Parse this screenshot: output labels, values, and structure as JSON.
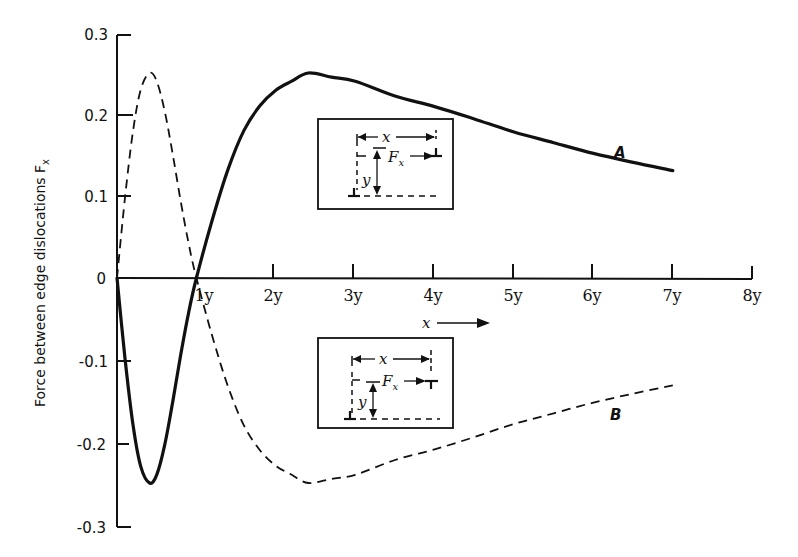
{
  "chart_data": {
    "type": "line",
    "title": "",
    "xlabel": "x",
    "ylabel": "Force between edge dislocations F_x",
    "xlim": [
      0,
      8
    ],
    "ylim": [
      -0.3,
      0.3
    ],
    "grid": false,
    "legend": "none (curves labeled inline A and B)",
    "x_ticks": [
      "1y",
      "2y",
      "3y",
      "4y",
      "5y",
      "6y",
      "7y",
      "8y"
    ],
    "y_ticks": [
      "0.3",
      "0.2",
      "0.1",
      "0",
      "-0.1",
      "-0.2",
      "-0.3"
    ],
    "x": [
      0,
      0.1,
      0.2,
      0.3,
      0.41,
      0.5,
      0.6,
      0.7,
      0.8,
      0.9,
      1.0,
      1.2,
      1.4,
      1.6,
      1.8,
      2.0,
      2.2,
      2.41,
      2.7,
      3.0,
      3.5,
      4.0,
      4.5,
      5.0,
      5.5,
      6.0,
      6.5,
      7.0
    ],
    "series": [
      {
        "name": "A",
        "style": "solid",
        "values": [
          0,
          -0.097,
          -0.178,
          -0.23,
          -0.25,
          -0.24,
          -0.204,
          -0.152,
          -0.095,
          -0.043,
          0,
          0.071,
          0.133,
          0.18,
          0.21,
          0.229,
          0.24,
          0.25,
          0.245,
          0.24,
          0.222,
          0.209,
          0.194,
          0.178,
          0.165,
          0.152,
          0.141,
          0.131
        ]
      },
      {
        "name": "B",
        "style": "dashed",
        "values": [
          0,
          0.097,
          0.178,
          0.23,
          0.25,
          0.24,
          0.204,
          0.152,
          0.095,
          0.043,
          0,
          -0.071,
          -0.133,
          -0.18,
          -0.21,
          -0.229,
          -0.24,
          -0.25,
          -0.245,
          -0.24,
          -0.222,
          -0.209,
          -0.194,
          -0.178,
          -0.165,
          -0.152,
          -0.141,
          -0.131
        ]
      }
    ],
    "annotations": [
      "Inset upper: two edge dislocations, separation x horizontal and y vertical, force F_x, same sign (curve A)",
      "Inset lower: two edge dislocations of opposite sign, separation x and y, force F_x (curve B)",
      "x → arrow under x-axis"
    ]
  },
  "labels": {
    "y_axis_title": "Force between edge dislocations F",
    "y_axis_title_sub": "x",
    "x_arrow_label": "x",
    "series_a": "A",
    "series_b": "B",
    "inset_x": "x",
    "inset_y": "y",
    "inset_F": "F",
    "inset_F_sub": "x"
  }
}
